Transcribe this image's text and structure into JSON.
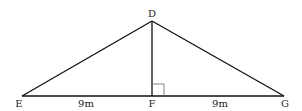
{
  "diagram": {
    "type": "triangle",
    "points": {
      "D": {
        "label": "D",
        "x": 152,
        "y": 21
      },
      "E": {
        "label": "E",
        "x": 22,
        "y": 96
      },
      "F": {
        "label": "F",
        "x": 152,
        "y": 96
      },
      "G": {
        "label": "G",
        "x": 284,
        "y": 96
      }
    },
    "segments": [
      {
        "from": "D",
        "to": "E"
      },
      {
        "from": "D",
        "to": "G"
      },
      {
        "from": "D",
        "to": "F"
      },
      {
        "from": "E",
        "to": "G"
      }
    ],
    "measures": {
      "EF": "9m",
      "FG": "9m"
    },
    "right_angle_at": "F",
    "colors": {
      "line": "#111111",
      "right_angle_marker": "#666666"
    }
  }
}
